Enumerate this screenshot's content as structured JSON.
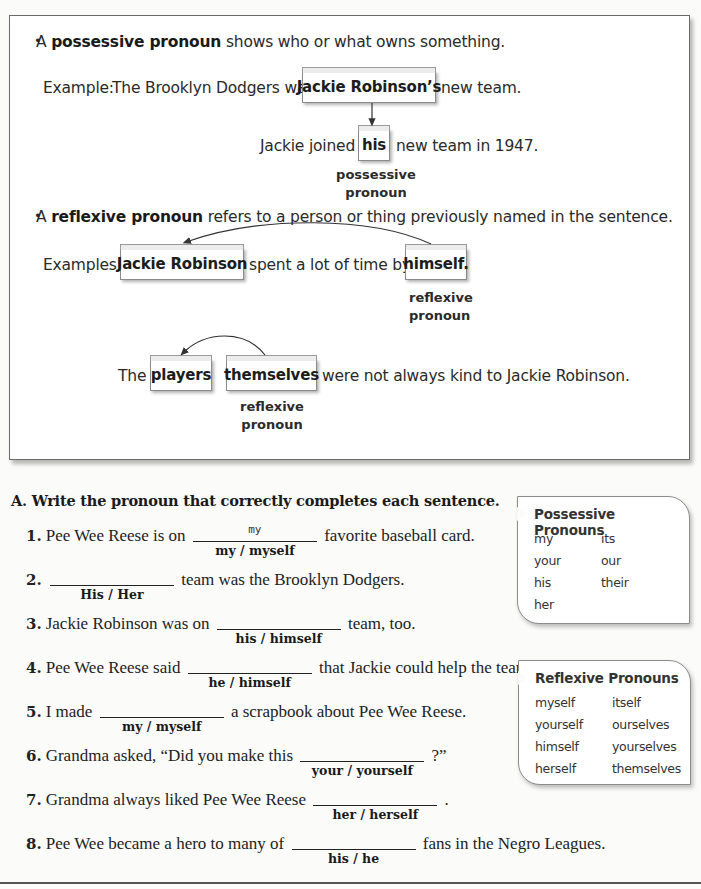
{
  "concept": {
    "possessive": {
      "bullet": "•",
      "intro_pre": "A ",
      "term": "possessive pronoun",
      "intro_post": " shows who or what owns something.",
      "example_label": "Example:",
      "example_pre": "The Brooklyn Dodgers was",
      "noun_box": "Jackie Robinson’s",
      "example_post": "new team.",
      "sentence2_pre": "Jackie joined",
      "pronoun_box": "his",
      "sentence2_post": "new team in 1947.",
      "caption_line1": "possessive",
      "caption_line2": "pronoun"
    },
    "reflexive": {
      "bullet": "•",
      "intro_pre": "A ",
      "term": "reflexive pronoun",
      "intro_post": " refers to a person or thing previously named in the sentence.",
      "example_label": "Examples:",
      "ex1_noun_box": "Jackie Robinson",
      "ex1_mid": "spent a lot of time by",
      "ex1_pronoun_box": "himself.",
      "ex1_caption_line1": "reflexive",
      "ex1_caption_line2": "pronoun",
      "ex2_pre": "The",
      "ex2_noun_box": "players",
      "ex2_pronoun_box": "themselves",
      "ex2_post": "were not always kind to Jackie Robinson.",
      "ex2_caption_line1": "reflexive",
      "ex2_caption_line2": "pronoun"
    }
  },
  "exercise": {
    "title": "A. Write the pronoun that correctly completes each sentence.",
    "items": [
      {
        "num": "1.",
        "pre": "Pee Wee Reese is on",
        "choices": "my / myself",
        "answer": "my",
        "post": "favorite baseball card."
      },
      {
        "num": "2.",
        "pre": "",
        "choices": "His / Her",
        "answer": "",
        "post": "team was the Brooklyn Dodgers."
      },
      {
        "num": "3.",
        "pre": "Jackie Robinson was on",
        "choices": "his / himself",
        "answer": "",
        "post": "team, too."
      },
      {
        "num": "4.",
        "pre": "Pee Wee Reese said",
        "choices": "he / himself",
        "answer": "",
        "post": "that Jackie could help the team."
      },
      {
        "num": "5.",
        "pre": "I made",
        "choices": "my / myself",
        "answer": "",
        "post": "a scrapbook about Pee Wee Reese."
      },
      {
        "num": "6.",
        "pre": "Grandma asked, “Did you make this",
        "choices": "your / yourself",
        "answer": "",
        "post": "?”"
      },
      {
        "num": "7.",
        "pre": "Grandma always liked Pee Wee Reese",
        "choices": "her / herself",
        "answer": "",
        "post": "."
      },
      {
        "num": "8.",
        "pre": "Pee Wee became a hero to many of",
        "choices": "his / he",
        "answer": "",
        "post": "fans in the Negro Leagues."
      }
    ]
  },
  "reference": {
    "possessive": {
      "title": "Possessive Pronouns",
      "col1": [
        "my",
        "your",
        "his",
        "her"
      ],
      "col2": [
        "its",
        "our",
        "their"
      ]
    },
    "reflexive": {
      "title": "Reflexive Pronouns",
      "col1": [
        "myself",
        "yourself",
        "himself",
        "herself"
      ],
      "col2": [
        "itself",
        "ourselves",
        "yourselves",
        "themselves"
      ]
    }
  }
}
